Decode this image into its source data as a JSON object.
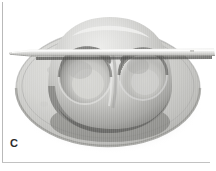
{
  "figure": {
    "panel_label": "C",
    "background_color": "#ffffff",
    "border_color": "#bdbdbd",
    "caption_text": "",
    "specimen": {
      "base_plate": {
        "name": "oval base plate",
        "fill_light": "#d8d8d6",
        "fill_mid": "#bdbdba",
        "fill_dark": "#9a9a97",
        "outline": "#6f6f6d",
        "center_x": 108,
        "center_y": 88,
        "radius_x": 92,
        "radius_y": 58
      },
      "cranium": {
        "name": "cranial dome",
        "fill_light": "#e2e2e0",
        "fill_mid": "#bcbcb9",
        "fill_dark": "#8b8b88",
        "outline": "#5a5a58",
        "center_x": 110,
        "center_y": 78,
        "radius_x": 62,
        "radius_y": 60
      },
      "orbit_left": {
        "name": "left orbital socket",
        "center_x": 85,
        "center_y": 76,
        "radius_x": 26,
        "radius_y": 27,
        "rim_color": "#6a6a67",
        "fill_color": "#c6c6c3"
      },
      "orbit_right": {
        "name": "right orbital socket",
        "center_x": 143,
        "center_y": 74,
        "radius_x": 24,
        "radius_y": 25,
        "rim_color": "#6a6a67",
        "fill_color": "#c4c4c1"
      },
      "rod": {
        "name": "horizontal metal rod",
        "x_start": 8,
        "x_end": 215,
        "y": 52,
        "thickness": 6,
        "highlight_color": "#f2f2f0",
        "body_color": "#cfcfcc",
        "shadow_color": "#4a4a48"
      }
    }
  }
}
